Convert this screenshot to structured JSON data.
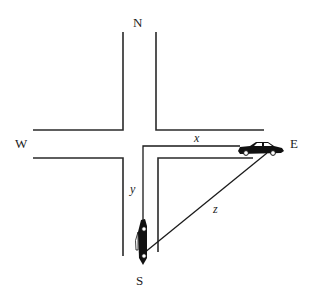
{
  "diagram": {
    "type": "intersection-related-rates",
    "compass": {
      "north": "N",
      "south": "S",
      "east": "E",
      "west": "W"
    },
    "variables": {
      "x": "x",
      "y": "y",
      "z": "z"
    },
    "objects": [
      {
        "name": "car-east",
        "heading": "east",
        "label": "E"
      },
      {
        "name": "car-south",
        "heading": "south",
        "label": "S"
      }
    ],
    "colors": {
      "lines": "#2a2a2a",
      "cars": "#111111",
      "background": "#ffffff"
    }
  }
}
